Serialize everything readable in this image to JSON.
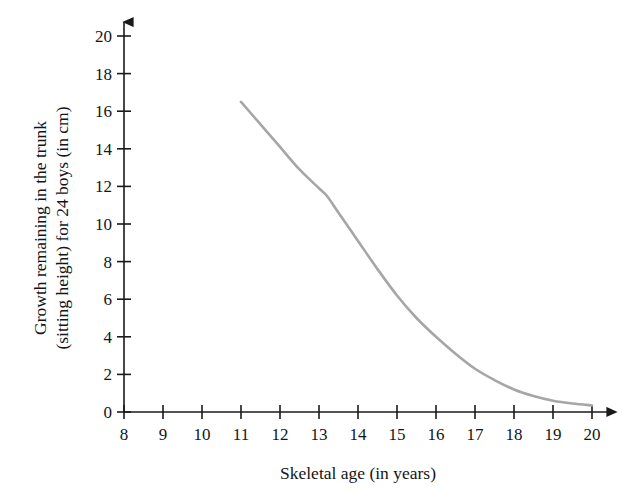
{
  "chart_data": {
    "type": "line",
    "title": "",
    "xlabel": "Skeletal age (in years)",
    "ylabel": "Growth remaining in the trunk (sitting height) for 24 boys (in cm)",
    "ylabel_line1": "Growth remaining in the trunk",
    "ylabel_line2": "(sitting height) for 24 boys (in cm)",
    "xlim": [
      8,
      20
    ],
    "ylim": [
      0,
      20
    ],
    "xticks": [
      8,
      9,
      10,
      11,
      12,
      13,
      14,
      15,
      16,
      17,
      18,
      19,
      20
    ],
    "yticks": [
      0,
      2,
      4,
      6,
      8,
      10,
      12,
      14,
      16,
      18,
      20
    ],
    "xtick_labels": [
      "8",
      "9",
      "10",
      "11",
      "12",
      "13",
      "14",
      "15",
      "16",
      "17",
      "18",
      "19",
      "20"
    ],
    "ytick_labels": [
      "0",
      "2",
      "4",
      "6",
      "8",
      "10",
      "12",
      "14",
      "16",
      "18",
      "20"
    ],
    "grid": false,
    "legend": false,
    "legend_position": "none",
    "axis_arrows": true,
    "series": [
      {
        "name": "Growth remaining in trunk",
        "color": "#a6a6a6",
        "x": [
          11.0,
          11.5,
          12.0,
          12.5,
          13.0,
          13.2,
          13.5,
          14.0,
          14.5,
          15.0,
          15.5,
          16.0,
          16.5,
          17.0,
          17.5,
          18.0,
          18.5,
          19.0,
          19.5,
          20.0
        ],
        "values": [
          16.5,
          15.3,
          14.1,
          12.9,
          11.9,
          11.5,
          10.6,
          9.1,
          7.6,
          6.2,
          5.0,
          4.0,
          3.1,
          2.3,
          1.7,
          1.2,
          0.85,
          0.6,
          0.45,
          0.35
        ]
      }
    ],
    "annotations": [],
    "colors": {
      "curve": "#a6a6a6",
      "axis": "#1a1a1a",
      "text": "#151515",
      "background": "#ffffff"
    }
  }
}
